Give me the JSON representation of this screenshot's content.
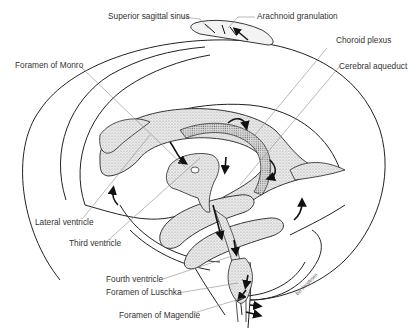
{
  "figure": {
    "labels": {
      "superior_sagittal_sinus": "Superior sagittal sinus",
      "arachnoid_granulation": "Arachnoid granulation",
      "choroid_plexus": "Choroid plexus",
      "foramen_of_monro": "Foramen of Monro",
      "cerebral_aqueduct": "Cerebral aqueduct",
      "lateral_ventricle": "Lateral  ventricle",
      "third_ventricle": "Third ventricle",
      "fourth_ventricle": "Fourth ventricle",
      "foramen_of_luschka": "Foramen of Luschka",
      "foramen_of_magendie": "Foramen of Magendie"
    },
    "signature": "Bo Jacobsen",
    "colors": {
      "line": "#222222",
      "leader": "#8a8a8a",
      "stipple": "#cfcfcf",
      "text": "#333333",
      "background": "#ffffff"
    }
  }
}
